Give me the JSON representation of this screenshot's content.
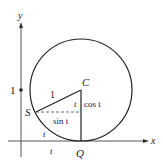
{
  "diagram": {
    "axes": {
      "x_label": "x",
      "y_label": "y",
      "tick_y_label": "1"
    },
    "points": {
      "center": "C",
      "contact": "Q",
      "trace": "S"
    },
    "segment_labels": {
      "radius": "1",
      "angle_at_center": "t",
      "vertical_leg": "cos t",
      "horizontal_leg": "sin t",
      "arc": "t",
      "axis_segment": "t"
    },
    "colors": {
      "stroke": "#222222",
      "axis": "#555555",
      "background": "#ffffff"
    }
  }
}
